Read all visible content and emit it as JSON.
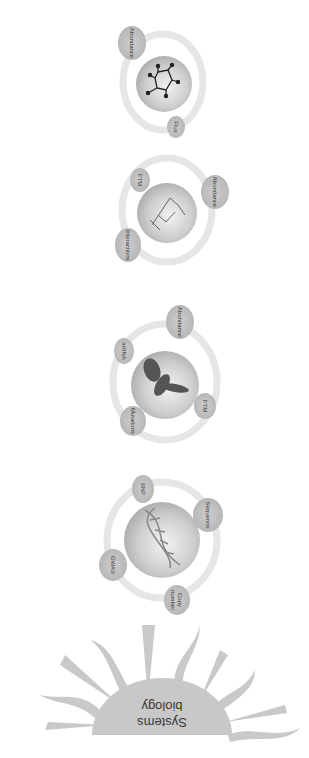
{
  "title": "Systems biology",
  "sun": {
    "label_line1": "Systems",
    "label_line2": "biology",
    "color": "#c4c4c4"
  },
  "groups": [
    {
      "name": "genome",
      "center_icon": "dna-helix-icon",
      "satellites": [
        {
          "label": "SNP"
        },
        {
          "label": "Sequence"
        },
        {
          "label": "GWAS"
        },
        {
          "label_line1": "Copy",
          "label_line2": "number"
        }
      ]
    },
    {
      "name": "transcriptome",
      "center_icon": "rna-structure-icon",
      "satellites": [
        {
          "label": "Abundance"
        },
        {
          "label": "mRNA"
        },
        {
          "label": "PTM"
        },
        {
          "label": "Mutations"
        }
      ]
    },
    {
      "name": "proteome",
      "center_icon": "protein-structure-icon",
      "satellites": [
        {
          "label": "PTM"
        },
        {
          "label": "Abundance"
        },
        {
          "label": "Interactions"
        }
      ]
    },
    {
      "name": "metabolome",
      "center_icon": "molecule-icon",
      "satellites": [
        {
          "label": "Abundance"
        },
        {
          "label": "Flux"
        }
      ]
    }
  ]
}
